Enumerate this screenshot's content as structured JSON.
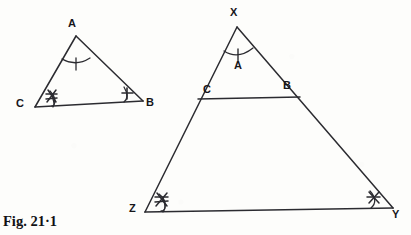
{
  "figure": {
    "caption": "Fig. 21·1",
    "ink_color": "#2b2b30",
    "background_color": "#fdfdfb",
    "label_color": "#16161a",
    "ghost_text_top": "·  ·   ·",
    "small_triangle": {
      "name": "triangle-ABC",
      "vertices": {
        "A": {
          "label": "A",
          "x": 76,
          "y": 36,
          "label_x": 68,
          "label_y": 18
        },
        "B": {
          "label": "B",
          "x": 143,
          "y": 101,
          "label_x": 146,
          "label_y": 101
        },
        "C": {
          "label": "C",
          "x": 35,
          "y": 107,
          "label_x": 18,
          "label_y": 101
        }
      },
      "angle_marks": {
        "A": {
          "ticks": 1,
          "name": "angle-mark-A"
        },
        "B": {
          "ticks": 1,
          "name": "angle-mark-B"
        },
        "C": {
          "ticks": 2,
          "name": "angle-mark-C"
        }
      }
    },
    "large_triangle": {
      "name": "triangle-XZY",
      "vertices": {
        "X": {
          "label": "X",
          "x": 237,
          "y": 27,
          "label_x": 230,
          "label_y": 9
        },
        "Y": {
          "label": "Y",
          "x": 393,
          "y": 208,
          "label_x": 393,
          "label_y": 209
        },
        "Z": {
          "label": "Z",
          "x": 145,
          "y": 212,
          "label_x": 130,
          "label_y": 206
        }
      },
      "inner_segment": {
        "name": "segment-CB",
        "from": {
          "label": "C",
          "x": 198,
          "y": 99,
          "label_x": 203,
          "label_y": 86
        },
        "to": {
          "label": "B",
          "x": 300,
          "y": 97,
          "label_x": 284,
          "label_y": 82
        }
      },
      "angle_marks": {
        "X": {
          "ticks": 1,
          "name": "angle-mark-X",
          "inner_label": "A"
        },
        "Y": {
          "ticks": 1,
          "name": "angle-mark-Y"
        },
        "Z": {
          "ticks": 2,
          "name": "angle-mark-Z"
        }
      }
    }
  }
}
